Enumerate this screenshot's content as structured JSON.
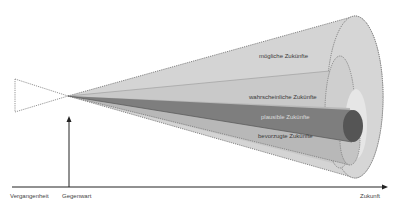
{
  "diagram": {
    "type": "futures-cone",
    "cone_labels": {
      "possible": "mögliche Zukünfte",
      "probable": "wahrscheinliche Zukünfte",
      "plausible": "plausible Zukünfte",
      "preferable": "bevorzugte Zukünfte"
    },
    "axis_labels": {
      "past": "Vergangenheit",
      "present": "Gegenwart",
      "future": "Zukunft"
    },
    "colors": {
      "possible": "#d4d4d4",
      "probable": "#c6c6c6",
      "preferable": "#b4b4b4",
      "plausible": "#7a7a7a",
      "plausible_end": "#555555",
      "outline": "#777777",
      "axis": "#222222"
    }
  }
}
